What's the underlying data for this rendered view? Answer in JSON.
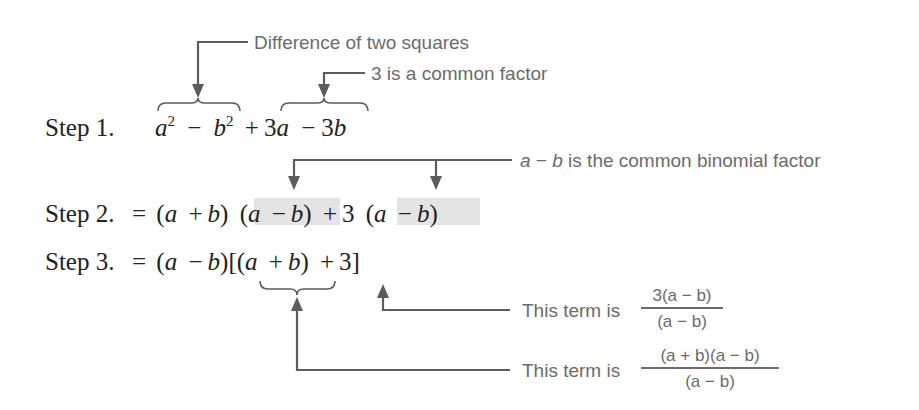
{
  "steps": [
    {
      "label": "Step 1.",
      "expression": "a² − b² + 3a − 3b",
      "parts": {
        "a": "a",
        "sq": "2",
        "minus": "−",
        "b": "b",
        "plus": "+",
        "three_a": "3",
        "three_b": "3"
      }
    },
    {
      "label": "Step 2.",
      "expression": "= (a + b) (a − b) + 3 (a − b)",
      "parts": {
        "eq": "=",
        "open": "(",
        "close": ")",
        "a": "a",
        "b": "b",
        "plus": "+",
        "minus": "−",
        "three": "3"
      }
    },
    {
      "label": "Step 3.",
      "expression": "= (a − b)[(a + b) + 3]",
      "parts": {
        "eq": "=",
        "open": "(",
        "close": ")",
        "a": "a",
        "b": "b",
        "plus": "+",
        "minus": "−",
        "three": "3",
        "lbracket": "[",
        "rbracket": "]"
      }
    }
  ],
  "annotations": {
    "difference_of_squares": "Difference of two squares",
    "common_factor": "3 is a common factor",
    "binomial_factor": {
      "var_a": "a",
      "minus": "−",
      "var_b": "b",
      "text": "is the common binomial factor",
      "full": "a − b is the common binomial factor"
    },
    "term_three": {
      "prefix": "This term is",
      "numerator": "3(a − b)",
      "denominator": "(a − b)"
    },
    "term_sum": {
      "prefix": "This term is",
      "numerator": "(a + b)(a − b)",
      "denominator": "(a − b)"
    }
  },
  "colors": {
    "math_text": "#222222",
    "annotation_text": "#6b6b6b",
    "arrow": "#5c5c5c",
    "highlight": "#e4e4e4"
  }
}
